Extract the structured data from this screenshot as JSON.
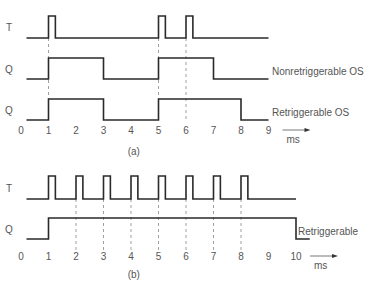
{
  "panel_a": {
    "caption": "(a)",
    "signals": [
      {
        "name": "T",
        "label": "T",
        "y_high": 16,
        "y_low": 38,
        "pulses": [
          [
            1.0,
            1.25
          ],
          [
            5.0,
            5.25
          ],
          [
            6.0,
            6.25
          ]
        ],
        "end": 9.0,
        "side_label": ""
      },
      {
        "name": "Q",
        "label": "Q",
        "y_high": 58,
        "y_low": 79,
        "pulses": [
          [
            1.0,
            3.0
          ],
          [
            5.0,
            7.0
          ]
        ],
        "end": 9.0,
        "side_label": "Nonretriggerable OS"
      },
      {
        "name": "Q",
        "label": "Q",
        "y_high": 99,
        "y_low": 120,
        "pulses": [
          [
            1.0,
            3.0
          ],
          [
            5.0,
            8.0
          ]
        ],
        "end": 9.0,
        "side_label": "Retriggerable OS"
      }
    ],
    "dashed_marks": [
      1,
      5,
      6
    ],
    "dash_top": 38,
    "dash_bottom": 122,
    "axis": {
      "ticks": [
        "0",
        "1",
        "2",
        "3",
        "4",
        "5",
        "6",
        "7",
        "8",
        "9"
      ],
      "unit": "ms",
      "tick_y": 134
    }
  },
  "panel_b": {
    "caption": "(b)",
    "signals": [
      {
        "name": "T",
        "label": "T",
        "y_high": 176,
        "y_low": 199,
        "pulses": [
          [
            1.0,
            1.25
          ],
          [
            2.0,
            2.25
          ],
          [
            3.0,
            3.25
          ],
          [
            4.0,
            4.25
          ],
          [
            5.0,
            5.25
          ],
          [
            6.0,
            6.25
          ],
          [
            7.0,
            7.25
          ],
          [
            8.0,
            8.25
          ]
        ],
        "end": 10.0,
        "side_label": ""
      },
      {
        "name": "Q",
        "label": "Q",
        "y_high": 218,
        "y_low": 239,
        "pulses": [
          [
            1.0,
            10.0
          ]
        ],
        "end": 10.5,
        "side_label": "Retriggerable"
      }
    ],
    "dashed_marks": [
      2,
      3,
      4,
      5,
      6,
      7,
      8
    ],
    "dash_top": 199,
    "dash_bottom": 250,
    "axis": {
      "ticks": [
        "0",
        "1",
        "2",
        "3",
        "4",
        "5",
        "6",
        "7",
        "8",
        "9",
        "10"
      ],
      "unit": "ms",
      "tick_y": 260
    }
  },
  "layout": {
    "x0": 21,
    "px_per_ms": 27.5,
    "line_start": 0.2
  }
}
